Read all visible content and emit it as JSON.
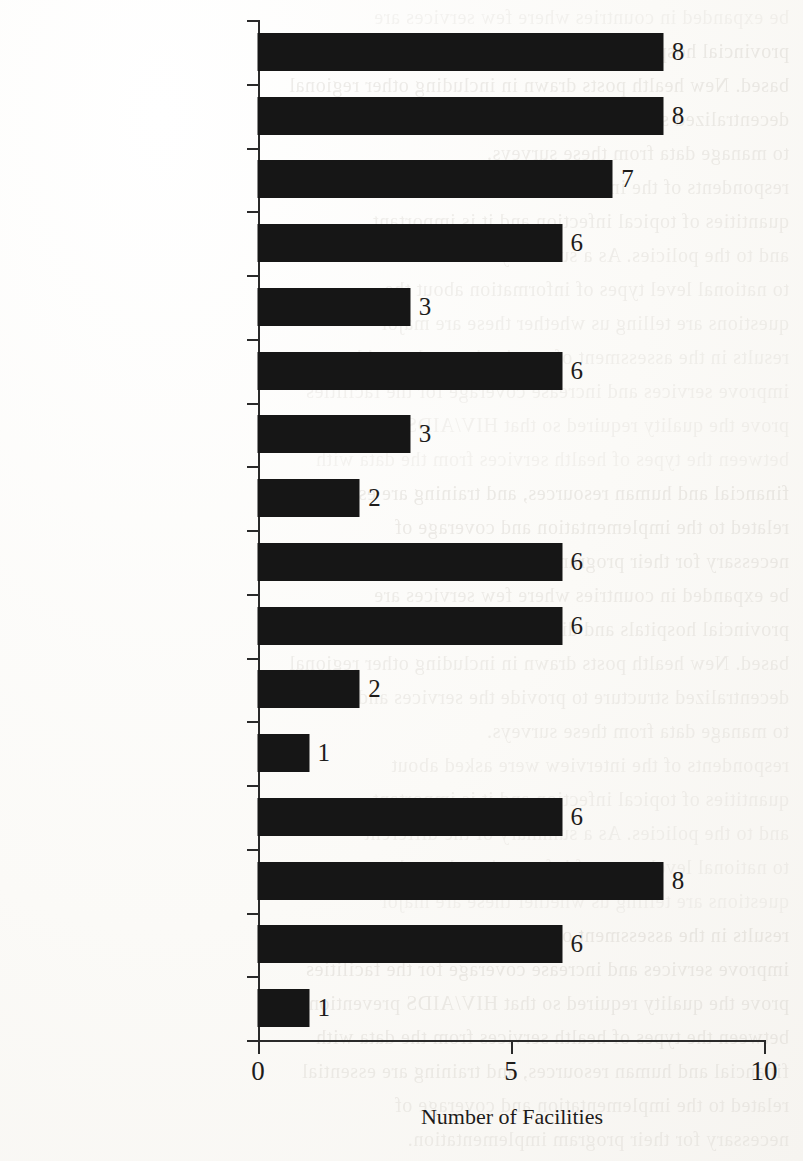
{
  "page": {
    "background_color": "#fdfcfa",
    "ink_color": "#161616",
    "bleed_through_lines": [
      "be expanded in countries where few services are",
      "provincial hospitals and district hospitals may be",
      "based. New health posts drawn in including other regional",
      "decentralized structure to provide the services and",
      "to manage data from these surveys.",
      "respondents of the interview were asked about",
      "quantities of topical infection and it is important",
      "and to the policies. As a summary of the different",
      "to national level types of information about the",
      "questions are telling us whether these are major",
      "results in the assessment of monitoring and providers",
      "improve services and increase coverage for the facilities",
      "prove the quality required so that HIV/AIDS prevention",
      "between the types of health services from the data with",
      "financial and human resources, and training are essential",
      "related to the implementation and coverage of",
      "necessary for their program implementation."
    ]
  },
  "chart_data": {
    "type": "bar",
    "orientation": "horizontal",
    "title": "",
    "subtitle": "",
    "xlabel": "Number of Facilities",
    "ylabel": "",
    "xlim": [
      0,
      10
    ],
    "ylim": null,
    "xticks": [
      0,
      5,
      10
    ],
    "xtick_labels": [
      "0",
      "5",
      "10"
    ],
    "grid": false,
    "legend": null,
    "series_color": "#161616",
    "show_value_labels": true,
    "categories": [
      "OI treatment",
      "Meds-topical fungus",
      "Pneumonia",
      "Other infection",
      "All OI meds",
      "Palliative care",
      "Meds-Vitamins",
      "Antidiarrhea",
      "Oral pain",
      "Deworm",
      "Intravenous",
      "All palliative care meds",
      "Trained provider OI",
      "Individual client record",
      "Service records",
      "Confidentiality protocol"
    ],
    "values": [
      8,
      8,
      7,
      6,
      3,
      6,
      3,
      2,
      6,
      6,
      2,
      1,
      6,
      8,
      6,
      1
    ],
    "value_labels": [
      "8",
      "8",
      "7",
      "6",
      "3",
      "6",
      "3",
      "2",
      "6",
      "6",
      "2",
      "1",
      "6",
      "8",
      "6",
      "1"
    ]
  }
}
